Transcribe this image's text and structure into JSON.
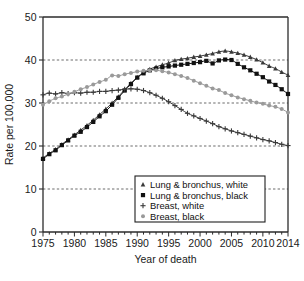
{
  "chart_data": {
    "type": "line",
    "title": "",
    "xlabel": "Year of death",
    "ylabel": "Rate per 100,000",
    "xlim": [
      1975,
      2014
    ],
    "ylim": [
      0,
      50
    ],
    "xticks": [
      1975,
      1980,
      1985,
      1990,
      1995,
      2000,
      2005,
      2010,
      2014
    ],
    "yticks": [
      0,
      10,
      20,
      30,
      40,
      50
    ],
    "grid": "horizontal-dashed",
    "gridlines": [
      10,
      20,
      30,
      40
    ],
    "minor_xticks": "every year",
    "legend_position": "lower-center-right",
    "x": [
      1975,
      1976,
      1977,
      1978,
      1979,
      1980,
      1981,
      1982,
      1983,
      1984,
      1985,
      1986,
      1987,
      1988,
      1989,
      1990,
      1991,
      1992,
      1993,
      1994,
      1995,
      1996,
      1997,
      1998,
      1999,
      2000,
      2001,
      2002,
      2003,
      2004,
      2005,
      2006,
      2007,
      2008,
      2009,
      2010,
      2011,
      2012,
      2013,
      2014
    ],
    "series": [
      {
        "name": "Lung & bronchus, white",
        "marker": "triangle",
        "color": "#3a3a3a",
        "values": [
          17.2,
          18.3,
          19.2,
          20.4,
          21.5,
          22.6,
          23.7,
          24.8,
          26.0,
          27.3,
          28.6,
          30.0,
          31.5,
          33.1,
          34.6,
          36.0,
          37.1,
          37.9,
          38.4,
          38.9,
          39.3,
          39.9,
          40.2,
          40.4,
          40.7,
          40.9,
          41.2,
          41.5,
          41.9,
          42.1,
          41.9,
          41.6,
          41.2,
          40.7,
          40.1,
          39.4,
          38.6,
          38.0,
          37.2,
          36.5
        ]
      },
      {
        "name": "Lung & bronchus, black",
        "marker": "square",
        "color": "#111111",
        "values": [
          17.0,
          18.1,
          19.0,
          20.2,
          21.3,
          22.4,
          23.3,
          24.4,
          25.6,
          26.9,
          28.1,
          29.6,
          31.2,
          32.9,
          34.4,
          35.9,
          36.9,
          37.6,
          38.0,
          38.3,
          38.5,
          38.7,
          38.9,
          39.1,
          39.3,
          39.5,
          39.8,
          39.2,
          39.9,
          40.1,
          40.0,
          39.1,
          38.3,
          37.6,
          36.8,
          36.0,
          35.0,
          34.2,
          33.2,
          32.1
        ]
      },
      {
        "name": "Breast, white",
        "marker": "plus",
        "color": "#3a3a3a",
        "values": [
          31.9,
          32.3,
          32.1,
          32.4,
          32.2,
          32.4,
          32.3,
          32.5,
          32.5,
          32.7,
          32.7,
          32.9,
          33.0,
          33.2,
          33.3,
          33.2,
          32.9,
          32.4,
          31.8,
          31.1,
          30.3,
          29.4,
          28.5,
          27.6,
          27.0,
          26.4,
          25.8,
          25.2,
          24.5,
          24.0,
          23.5,
          23.1,
          22.7,
          22.3,
          21.9,
          21.5,
          21.2,
          20.8,
          20.4,
          20.1
        ]
      },
      {
        "name": "Breast, black",
        "marker": "circle",
        "color": "#9a9a9a",
        "values": [
          29.6,
          30.4,
          31.1,
          31.5,
          32.1,
          32.6,
          33.2,
          33.7,
          34.3,
          34.9,
          35.4,
          36.4,
          36.3,
          36.7,
          37.0,
          37.3,
          37.5,
          37.6,
          37.6,
          37.4,
          37.1,
          36.7,
          36.3,
          35.8,
          35.2,
          34.6,
          34.0,
          33.4,
          33.0,
          32.3,
          31.8,
          31.3,
          30.9,
          30.5,
          30.1,
          29.8,
          29.4,
          29.1,
          28.6,
          27.8
        ]
      }
    ]
  },
  "legend": {
    "items": [
      {
        "label": "Lung & bronchus, white",
        "marker": "triangle"
      },
      {
        "label": "Lung & bronchus, black",
        "marker": "square"
      },
      {
        "label": "Breast, white",
        "marker": "plus"
      },
      {
        "label": "Breast, black",
        "marker": "circle"
      }
    ]
  },
  "caption": {
    "text": ""
  }
}
